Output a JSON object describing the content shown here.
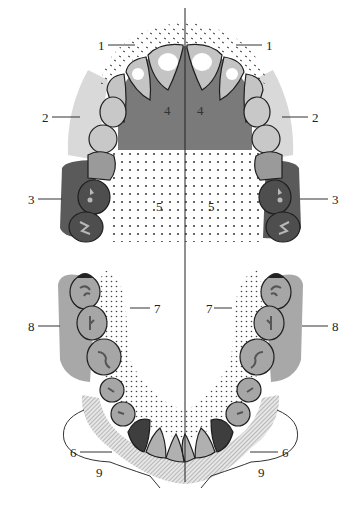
{
  "figure": {
    "colors": {
      "background": "#ffffff",
      "outline": "#1e1e1e",
      "tooth_light": "#c4c4c4",
      "tooth_mid": "#8e8e8e",
      "region_2_light": "#d9d9d9",
      "region_3_dark": "#5a5a5a",
      "region_4_palate": "#7a7a7a",
      "region_8_gray": "#a8a8a8",
      "dots": "#333333"
    },
    "midline": {
      "x": 185,
      "y_top": 8,
      "y_bottom": 482
    }
  },
  "labels": {
    "upper": [
      {
        "id": "1L",
        "text": "1",
        "x": 98,
        "y": 40
      },
      {
        "id": "1R",
        "text": "1",
        "x": 268,
        "y": 40
      },
      {
        "id": "2L",
        "text": "2",
        "x": 44,
        "y": 112
      },
      {
        "id": "2R",
        "text": "2",
        "x": 313,
        "y": 112
      },
      {
        "id": "3L",
        "text": "3",
        "x": 30,
        "y": 194
      },
      {
        "id": "3R",
        "text": "3",
        "x": 333,
        "y": 194
      },
      {
        "id": "4L",
        "text": "4",
        "x": 163,
        "y": 105
      },
      {
        "id": "4R",
        "text": "4",
        "x": 197,
        "y": 105
      },
      {
        "id": "5L",
        "text": "5",
        "x": 155,
        "y": 200
      },
      {
        "id": "5R",
        "text": "5",
        "x": 208,
        "y": 200
      }
    ],
    "lower": [
      {
        "id": "7L",
        "text": "7",
        "x": 155,
        "y": 303
      },
      {
        "id": "7R",
        "text": "7",
        "x": 208,
        "y": 303
      },
      {
        "id": "8L",
        "text": "8",
        "x": 30,
        "y": 321
      },
      {
        "id": "8R",
        "text": "8",
        "x": 333,
        "y": 321
      },
      {
        "id": "6L",
        "text": "6",
        "x": 70,
        "y": 447
      },
      {
        "id": "6R",
        "text": "6",
        "x": 282,
        "y": 447
      },
      {
        "id": "9L",
        "text": "9",
        "x": 96,
        "y": 467
      },
      {
        "id": "9R",
        "text": "9",
        "x": 258,
        "y": 467
      }
    ]
  }
}
